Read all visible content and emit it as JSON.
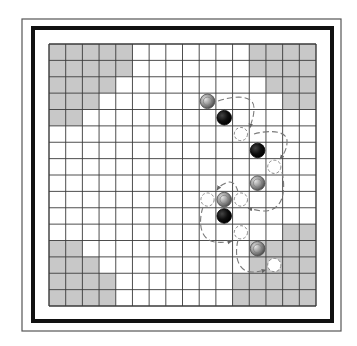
{
  "diagram": {
    "grid": {
      "rows": 16,
      "cols": 16,
      "x": 49,
      "y": 44,
      "width": 267,
      "height": 262
    },
    "colors": {
      "background": "#ffffff",
      "grid_line": "#3a3a3a",
      "shaded_cell": "#c8c8c8",
      "outer_border": "#444444",
      "thick_border": "#111111",
      "black_piece": "#111111",
      "gray_piece_light": "#d6d6d6",
      "gray_piece_dark": "#6a6a6a",
      "dashed_circle": "#8a8a8a",
      "arrow": "#7a7a7a"
    },
    "shaded_regions": {
      "top_left": [
        [
          0,
          0,
          4
        ],
        [
          1,
          0,
          4
        ],
        [
          2,
          0,
          3
        ],
        [
          3,
          0,
          2
        ],
        [
          4,
          0,
          1
        ]
      ],
      "top_right": [
        [
          0,
          12,
          15
        ],
        [
          1,
          12,
          15
        ],
        [
          2,
          13,
          15
        ],
        [
          3,
          14,
          15
        ]
      ],
      "bottom_left": [
        [
          12,
          0,
          1
        ],
        [
          13,
          0,
          2
        ],
        [
          14,
          0,
          3
        ],
        [
          15,
          0,
          3
        ]
      ],
      "bottom_right": [
        [
          11,
          14,
          15
        ],
        [
          12,
          12,
          15
        ],
        [
          13,
          12,
          15
        ],
        [
          14,
          11,
          15
        ],
        [
          15,
          11,
          15
        ]
      ]
    },
    "pieces": [
      {
        "type": "gray-piece",
        "row": 3,
        "col": 9
      },
      {
        "type": "black-piece",
        "row": 4,
        "col": 10
      },
      {
        "type": "black-piece",
        "row": 6,
        "col": 12
      },
      {
        "type": "gray-piece",
        "row": 8,
        "col": 12
      },
      {
        "type": "gray-piece",
        "row": 9,
        "col": 10
      },
      {
        "type": "black-piece",
        "row": 10,
        "col": 10
      },
      {
        "type": "gray-piece",
        "row": 12,
        "col": 12
      }
    ],
    "landing_spots": [
      {
        "row": 5,
        "col": 11
      },
      {
        "row": 7,
        "col": 13
      },
      {
        "row": 9,
        "col": 9
      },
      {
        "row": 9,
        "col": 11
      },
      {
        "row": 11,
        "col": 11
      },
      {
        "row": 13,
        "col": 13
      }
    ],
    "jump_arrows": [
      {
        "from": [
          3,
          9
        ],
        "to": [
          5,
          11
        ],
        "path": "M218,101 C236,95 254,95 254,108 C254,118 251,122 250,128"
      },
      {
        "from": [
          5,
          11
        ],
        "to": [
          7,
          13
        ],
        "path": "M254,134 C268,130 288,130 287,142 C287,150 283,155 280,159"
      },
      {
        "from": [
          7,
          13
        ],
        "to": [
          9,
          11
        ],
        "path": "M282,172 C286,190 284,212 262,211 C255,210 251,209 248,208"
      },
      {
        "from": [
          9,
          11
        ],
        "to": [
          9,
          9
        ],
        "path": "M238,192 C236,184 232,180 226,183 C221,185 219,187 217,190"
      },
      {
        "from": [
          9,
          9
        ],
        "to": [
          11,
          11
        ],
        "path": "M203,207 C198,222 200,240 215,242 C222,243 228,242 232,241"
      },
      {
        "from": [
          11,
          11
        ],
        "to": [
          13,
          13
        ],
        "path": "M238,240 C234,256 238,272 252,272 C258,272 262,271 266,270"
      }
    ]
  }
}
